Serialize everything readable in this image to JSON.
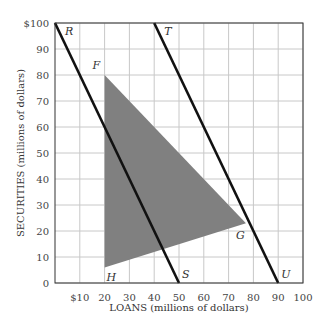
{
  "chart_data": {
    "type": "line",
    "title": "",
    "xlabel": "LOANS (millions of dollars)",
    "ylabel": "SECURITIES (millions of dollars)",
    "xlim": [
      0,
      100
    ],
    "ylim": [
      0,
      100
    ],
    "grid": true,
    "x_ticks": [
      "$10",
      "20",
      "30",
      "40",
      "50",
      "60",
      "70",
      "80",
      "90",
      "100"
    ],
    "x_tick_values": [
      10,
      20,
      30,
      40,
      50,
      60,
      70,
      80,
      90,
      100
    ],
    "y_ticks": [
      "0",
      "10",
      "20",
      "30",
      "40",
      "50",
      "60",
      "70",
      "80",
      "90",
      "$100"
    ],
    "y_tick_values": [
      0,
      10,
      20,
      30,
      40,
      50,
      60,
      70,
      80,
      90,
      100
    ],
    "series": [
      {
        "name": "RS",
        "start_label": "R",
        "end_label": "S",
        "points": [
          [
            0,
            100
          ],
          [
            50,
            0
          ]
        ]
      },
      {
        "name": "TU",
        "start_label": "T",
        "end_label": "U",
        "points": [
          [
            40,
            100
          ],
          [
            90,
            0
          ]
        ]
      }
    ],
    "shaded_region": {
      "name": "FGH",
      "color": "#808080",
      "vertices": [
        {
          "label": "F",
          "x": 20,
          "y": 80
        },
        {
          "label": "G",
          "x": 77,
          "y": 23
        },
        {
          "label": "H",
          "x": 20,
          "y": 6
        }
      ]
    }
  }
}
